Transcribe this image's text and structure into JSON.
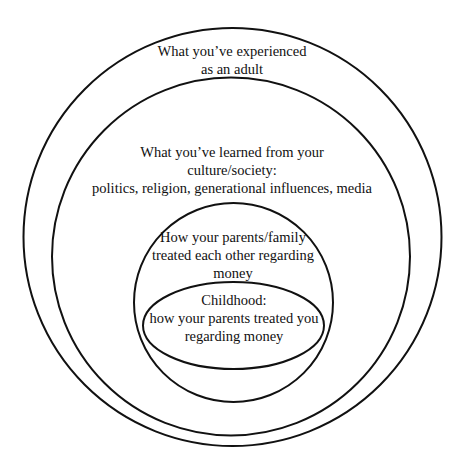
{
  "diagram": {
    "type": "nested-circles",
    "rings": [
      {
        "id": "adult",
        "shape": "circle",
        "lines": [
          "What you’ve experienced",
          "as an adult"
        ]
      },
      {
        "id": "culture",
        "shape": "circle",
        "lines": [
          "What you’ve learned from your",
          "culture/society:",
          "politics, religion, generational influences, media"
        ]
      },
      {
        "id": "family",
        "shape": "circle",
        "lines": [
          "How your parents/family",
          "treated each other regarding",
          "money"
        ]
      },
      {
        "id": "childhood",
        "shape": "ellipse",
        "lines": [
          "Childhood:",
          "how your parents treated you",
          "regarding money"
        ]
      }
    ],
    "stroke_color": "#111111",
    "background": "#ffffff"
  }
}
